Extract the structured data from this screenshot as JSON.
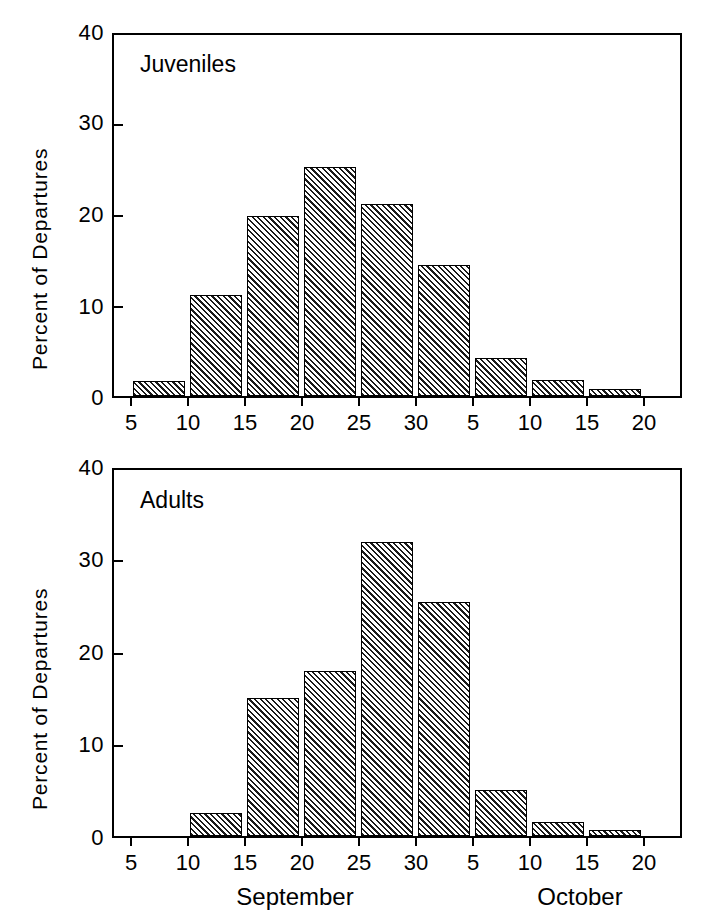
{
  "figure": {
    "background_color": "#ffffff",
    "line_color": "#000000",
    "hatch_color": "#1a1a1a"
  },
  "chart_data": [
    {
      "type": "bar",
      "title": "Juveniles",
      "panel": "top",
      "xlabel": "",
      "ylabel": "Percent of Departures",
      "ylim": [
        0,
        40
      ],
      "ytick_labels": [
        "0",
        "10",
        "20",
        "30",
        "40"
      ],
      "ytick_values": [
        0,
        10,
        20,
        30,
        40
      ],
      "grid": false,
      "legend": "none",
      "xtick_labels": [
        "5",
        "10",
        "15",
        "20",
        "25",
        "30",
        "5",
        "10",
        "15",
        "20"
      ],
      "xtick_values": [
        5,
        10,
        15,
        20,
        25,
        30,
        35,
        40,
        45,
        50
      ],
      "month_groups": [],
      "bin_labels": [
        "Sep 5-10",
        "Sep 10-15",
        "Sep 15-20",
        "Sep 20-25",
        "Sep 25-30",
        "Sep 30-Oct 5",
        "Oct 5-10",
        "Oct 10-15",
        "Oct 15-20"
      ],
      "bin_starts": [
        5,
        10,
        15,
        20,
        25,
        30,
        35,
        40,
        45
      ],
      "values": [
        1.7,
        11.2,
        19.9,
        25.4,
        21.3,
        14.5,
        4.2,
        1.8,
        0.8
      ]
    },
    {
      "type": "bar",
      "title": "Adults",
      "panel": "bottom",
      "xlabel": "",
      "ylabel": "Percent of Departures",
      "ylim": [
        0,
        40
      ],
      "ytick_labels": [
        "0",
        "10",
        "20",
        "30",
        "40"
      ],
      "ytick_values": [
        0,
        10,
        20,
        30,
        40
      ],
      "grid": false,
      "legend": "none",
      "xtick_labels": [
        "5",
        "10",
        "15",
        "20",
        "25",
        "30",
        "5",
        "10",
        "15",
        "20"
      ],
      "xtick_values": [
        5,
        10,
        15,
        20,
        25,
        30,
        35,
        40,
        45,
        50
      ],
      "month_groups": [
        "September",
        "October"
      ],
      "bin_labels": [
        "Sep 5-10",
        "Sep 10-15",
        "Sep 15-20",
        "Sep 20-25",
        "Sep 25-30",
        "Sep 30-Oct 5",
        "Oct 5-10",
        "Oct 10-15",
        "Oct 15-20"
      ],
      "bin_starts": [
        5,
        10,
        15,
        20,
        25,
        30,
        35,
        40,
        45
      ],
      "values": [
        0,
        2.5,
        15.1,
        18.0,
        32.1,
        25.6,
        5.0,
        1.5,
        0.7
      ]
    }
  ],
  "axis_labels": {
    "month_september": "September",
    "month_october": "October"
  }
}
